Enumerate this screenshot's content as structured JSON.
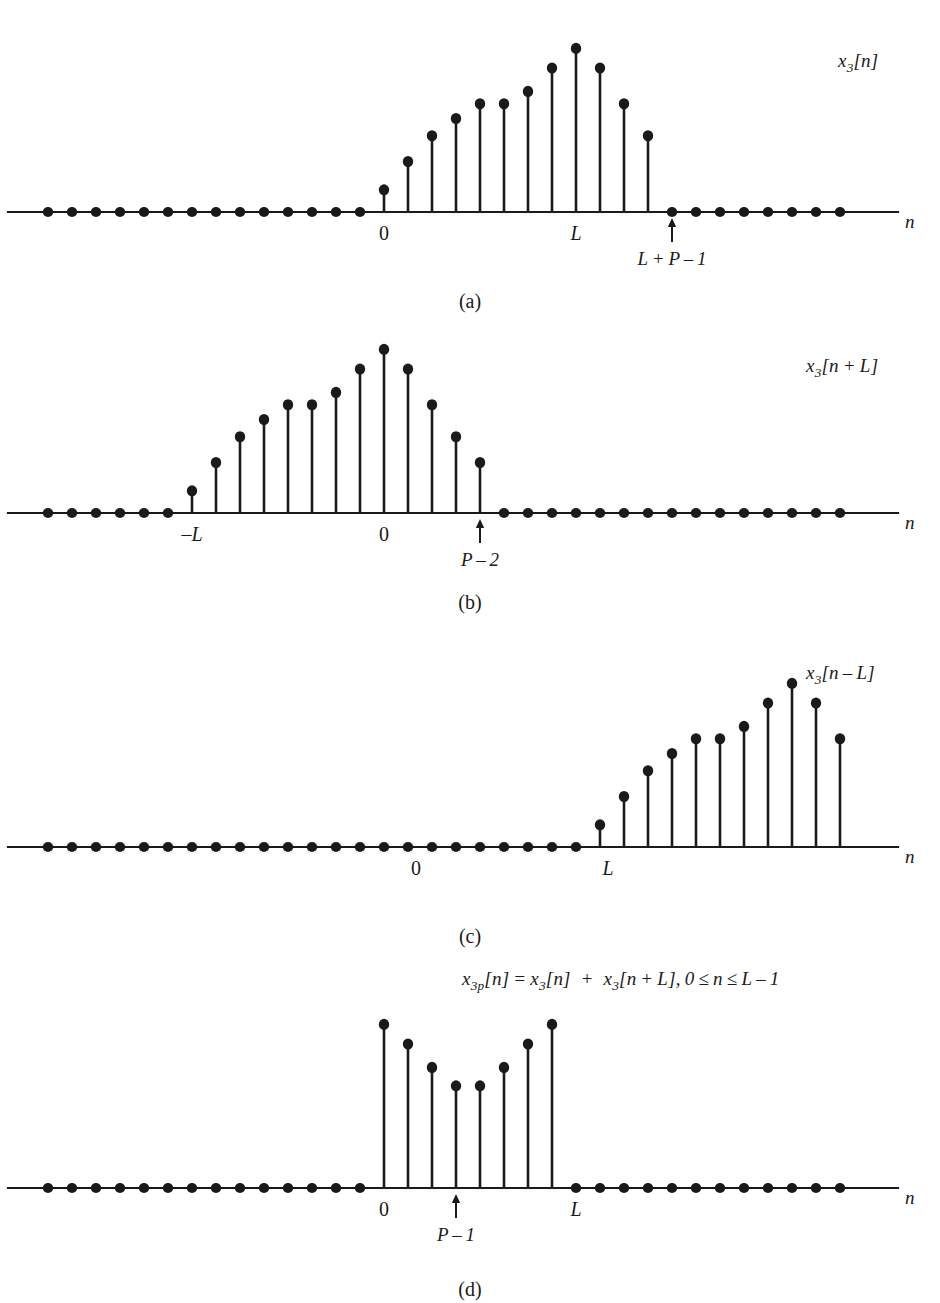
{
  "figure": {
    "axis_name": "n",
    "background_color": "#ffffff",
    "ink_color": "#1a1a1a"
  },
  "panels": [
    {
      "id": "a",
      "caption": "(a)",
      "signal_label_html": "x<sub>3</sub>[n]",
      "signal_label_text": "x3[n]",
      "axis_label": "n",
      "tick_labels": [
        {
          "text": "0",
          "italic": false,
          "index": 14
        },
        {
          "text": "L",
          "italic": true,
          "index": 22
        }
      ],
      "arrow_annotations": [
        {
          "text": "L + P – 1",
          "index": 26
        }
      ]
    },
    {
      "id": "b",
      "caption": "(b)",
      "signal_label_html": "x<sub>3</sub>[n + L]",
      "signal_label_text": "x3[n + L]",
      "axis_label": "n",
      "tick_labels": [
        {
          "text": "–L",
          "italic": true,
          "index": 6
        },
        {
          "text": "0",
          "italic": false,
          "index": 14
        }
      ],
      "arrow_annotations": [
        {
          "text": "P – 2",
          "index": 18
        }
      ]
    },
    {
      "id": "c",
      "caption": "(c)",
      "signal_label_html": "x<sub>3</sub>[n – L]",
      "signal_label_text": "x3[n - L]",
      "axis_label": "n",
      "tick_labels": [
        {
          "text": "0",
          "italic": false,
          "index": 15
        },
        {
          "text": "L",
          "italic": true,
          "index": 23
        }
      ],
      "arrow_annotations": []
    },
    {
      "id": "d",
      "caption": "(d)",
      "signal_label_html": "x<sub>3p</sub>[n] = x<sub>3</sub>[n] &nbsp;+&nbsp; x<sub>3</sub>[n + L], 0 ≤ n ≤ L – 1",
      "signal_label_text": "x3p[n] = x3[n] + x3[n + L], 0 <= n <= L - 1",
      "axis_label": "n",
      "tick_labels": [
        {
          "text": "0",
          "italic": false,
          "index": 14
        },
        {
          "text": "L",
          "italic": true,
          "index": 22
        }
      ],
      "arrow_annotations": [
        {
          "text": "P – 1",
          "index": 17
        }
      ]
    }
  ],
  "chart_data": {
    "type": "line",
    "subtype": "stem-plot",
    "xlabel": "n",
    "ylabel": "",
    "grid": false,
    "legend": "none",
    "sample_spacing_px": 24,
    "sample_count": 34,
    "plots": [
      {
        "id": "a",
        "name": "x3[n]",
        "x_start_index": 0,
        "nonzero_start_index": 14,
        "values": [
          0,
          0,
          0,
          0,
          0,
          0,
          0,
          0,
          0,
          0,
          0,
          0,
          0,
          0,
          0.18,
          0.41,
          0.62,
          0.76,
          0.88,
          0.88,
          0.98,
          1.17,
          1.33,
          1.17,
          0.88,
          0.62,
          0,
          0,
          0,
          0,
          0,
          0,
          0,
          0
        ],
        "reference_points": {
          "zero": 14,
          "L": 22,
          "L_plus_P_minus_1": 26
        }
      },
      {
        "id": "b",
        "name": "x3[n + L]",
        "x_start_index": 0,
        "nonzero_start_index": 6,
        "values": [
          0,
          0,
          0,
          0,
          0,
          0,
          0.18,
          0.41,
          0.62,
          0.76,
          0.88,
          0.88,
          0.98,
          1.17,
          1.33,
          1.17,
          0.88,
          0.62,
          0.41,
          0,
          0,
          0,
          0,
          0,
          0,
          0,
          0,
          0,
          0,
          0,
          0,
          0,
          0,
          0
        ],
        "reference_points": {
          "minus_L": 6,
          "zero": 14,
          "P_minus_2": 18
        }
      },
      {
        "id": "c",
        "name": "x3[n - L]",
        "x_start_index": 0,
        "nonzero_start_index": 23,
        "values": [
          0,
          0,
          0,
          0,
          0,
          0,
          0,
          0,
          0,
          0,
          0,
          0,
          0,
          0,
          0,
          0,
          0,
          0,
          0,
          0,
          0,
          0,
          0,
          0.18,
          0.41,
          0.62,
          0.76,
          0.88,
          0.88,
          0.98,
          1.17,
          1.33,
          1.17,
          0.88
        ],
        "reference_points": {
          "zero": 15,
          "L": 23
        }
      },
      {
        "id": "d",
        "name": "x3p[n]",
        "x_start_index": 0,
        "nonzero_start_index": 14,
        "values": [
          0,
          0,
          0,
          0,
          0,
          0,
          0,
          0,
          0,
          0,
          0,
          0,
          0,
          0,
          1.33,
          1.17,
          0.98,
          0.83,
          0.83,
          0.98,
          1.17,
          1.33,
          0,
          0,
          0,
          0,
          0,
          0,
          0,
          0,
          0,
          0,
          0,
          0
        ],
        "reference_points": {
          "zero": 14,
          "P_minus_1": 17,
          "L": 22
        }
      }
    ]
  }
}
